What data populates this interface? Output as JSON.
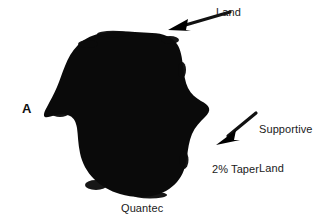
{
  "figure": {
    "panel_letter": "A",
    "specimen_name": "Quantec",
    "background_color": "#ffffff",
    "silhouette_color": "#0a0a0a",
    "text_color": "#1a1a1a"
  },
  "annotations": [
    {
      "id": "land",
      "label": "Land",
      "arrow": "arrow-land",
      "points_to": "upper-right shoulder of cross-section"
    },
    {
      "id": "supportive-land",
      "label": "Supportive\nLand",
      "line1": "Supportive",
      "line2": "Land",
      "arrow": "arrow-supportive-land",
      "points_to": "lower-right flute of cross-section"
    },
    {
      "id": "taper",
      "label": "2% Taper",
      "arrow": null,
      "points_to": "lower-right region"
    }
  ],
  "caption": {
    "specimen": "Quantec"
  }
}
